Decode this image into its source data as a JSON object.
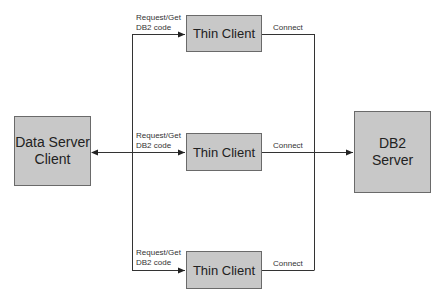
{
  "diagram": {
    "nodes": {
      "data_server_client": {
        "line1": "Data Server",
        "line2": "Client"
      },
      "thin_client_top": {
        "label": "Thin Client"
      },
      "thin_client_middle": {
        "label": "Thin Client"
      },
      "thin_client_bottom": {
        "label": "Thin Client"
      },
      "db2_server": {
        "line1": "DB2",
        "line2": "Server"
      }
    },
    "edges": {
      "request_top": {
        "line1": "Request/Get",
        "line2": "DB2 code"
      },
      "request_middle": {
        "line1": "Request/Get",
        "line2": "DB2 code"
      },
      "request_bottom": {
        "line1": "Request/Get",
        "line2": "DB2 code"
      },
      "connect_top": "Connect",
      "connect_middle": "Connect",
      "connect_bottom": "Connect"
    },
    "colors": {
      "box_fill": "#c8c8c8",
      "box_border": "#6a6a6a",
      "line": "#333333"
    }
  }
}
